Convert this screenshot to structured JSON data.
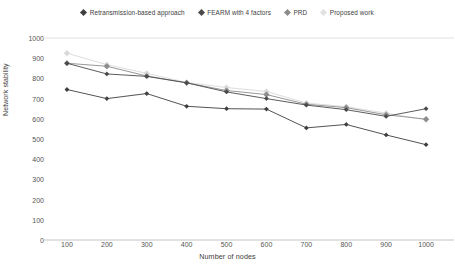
{
  "chart_data": {
    "type": "line",
    "title": "",
    "xlabel": "Number of nodes",
    "ylabel": "Network stability",
    "categories": [
      100,
      200,
      300,
      400,
      500,
      600,
      700,
      800,
      900,
      1000
    ],
    "x": [
      100,
      200,
      300,
      400,
      500,
      600,
      700,
      800,
      900,
      1000
    ],
    "xlim": [
      0,
      1000
    ],
    "ylim": [
      0,
      1000
    ],
    "yticks": [
      0,
      100,
      200,
      300,
      400,
      500,
      600,
      700,
      800,
      900,
      1000
    ],
    "xticks": [
      100,
      200,
      300,
      400,
      500,
      600,
      700,
      800,
      900,
      1000
    ],
    "grid": "top-line-only",
    "legend_position": "top-center",
    "marker": "diamond",
    "series": [
      {
        "name": "Retransmission-based approach",
        "color": "#3f3f3f",
        "values": [
          745,
          700,
          725,
          662,
          650,
          648,
          555,
          572,
          520,
          472
        ]
      },
      {
        "name": "FEARM with 4 factors",
        "color": "#4a4a4a",
        "values": [
          875,
          822,
          810,
          778,
          733,
          700,
          668,
          645,
          612,
          650
        ]
      },
      {
        "name": "PRD",
        "color": "#8c8c8c",
        "values": [
          875,
          860,
          812,
          778,
          740,
          720,
          672,
          655,
          620,
          598
        ]
      },
      {
        "name": "Proposed work",
        "color": "#d9d9d9",
        "values": [
          925,
          868,
          825,
          780,
          755,
          735,
          678,
          660,
          628,
          595
        ]
      }
    ]
  },
  "legend": {
    "items": [
      {
        "label": "Retransmission-based approach",
        "color": "#3f3f3f"
      },
      {
        "label": "FEARM with 4 factors",
        "color": "#4a4a4a"
      },
      {
        "label": "PRD",
        "color": "#8c8c8c"
      },
      {
        "label": "Proposed work",
        "color": "#e0e0e0"
      }
    ]
  },
  "axes": {
    "y_title": "Network stability",
    "x_title": "Number of nodes",
    "y_labels": [
      "1000",
      "900",
      "800",
      "700",
      "600",
      "500",
      "400",
      "300",
      "200",
      "100",
      "0"
    ],
    "x_labels": [
      "100",
      "200",
      "300",
      "400",
      "500",
      "600",
      "700",
      "800",
      "900",
      "1000"
    ]
  },
  "style": {
    "background": "#ffffff",
    "gridline_color": "#dcdcdc",
    "axis_color": "#bdbdbd"
  }
}
